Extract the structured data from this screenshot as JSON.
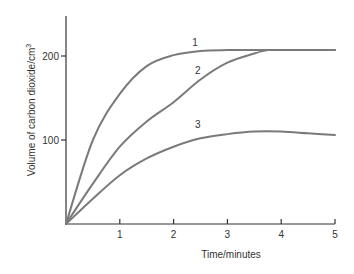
{
  "chart_data": {
    "type": "line",
    "title": "",
    "xlabel": "Time/minutes",
    "ylabel": "Volume of carbon dioxide/cm³",
    "ylabel_main": "Volume of carbon dioxide/cm",
    "ylabel_sup": "3",
    "xlim": [
      0,
      5
    ],
    "ylim": [
      0,
      250
    ],
    "x_ticks": [
      1,
      2,
      3,
      4,
      5
    ],
    "x_tick_labels": [
      "1",
      "2",
      "3",
      "4",
      "5"
    ],
    "y_ticks": [
      100,
      200
    ],
    "y_tick_labels": [
      "100",
      "200"
    ],
    "grid": false,
    "legend": "inline curve labels",
    "series": [
      {
        "name": "1",
        "x": [
          0,
          0.5,
          1,
          1.5,
          2,
          2.5,
          3,
          3.5,
          4,
          4.5,
          5
        ],
        "values": [
          0,
          100,
          155,
          188,
          201,
          206,
          207,
          207,
          207,
          207,
          207
        ],
        "label_pos": [
          2.4,
          212
        ]
      },
      {
        "name": "2",
        "x": [
          0,
          0.5,
          1,
          1.5,
          2,
          2.5,
          3,
          3.5,
          3.75,
          4,
          4.5,
          5
        ],
        "values": [
          0,
          48,
          92,
          122,
          145,
          172,
          192,
          203,
          207,
          207,
          207,
          207
        ],
        "label_pos": [
          2.45,
          178
        ]
      },
      {
        "name": "3",
        "x": [
          0,
          0.5,
          1,
          1.5,
          2,
          2.5,
          3,
          3.5,
          4,
          4.5,
          5
        ],
        "values": [
          0,
          30,
          58,
          78,
          92,
          102,
          107,
          110,
          110,
          108,
          106
        ],
        "label_pos": [
          2.45,
          114
        ]
      }
    ]
  }
}
